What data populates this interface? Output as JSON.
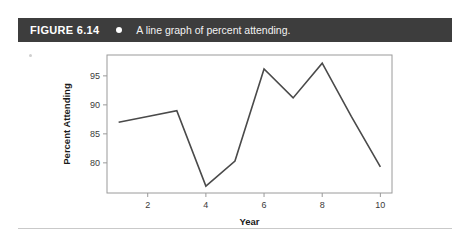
{
  "header": {
    "figure_number": "FIGURE 6.14",
    "bullet_icon": "bullet-dot-icon",
    "caption": "A line graph of percent attending.",
    "background_color": "#3d3d3d",
    "text_color": "#ffffff"
  },
  "chart_data": {
    "type": "line",
    "title": "",
    "xlabel": "Year",
    "ylabel": "Percent Attending",
    "x": [
      1,
      2,
      3,
      4,
      5,
      6,
      7,
      8,
      9,
      10
    ],
    "values": [
      87,
      88,
      89,
      76,
      80.3,
      96.2,
      91.2,
      97.2,
      88,
      79.3
    ],
    "series": [
      {
        "name": "Percent Attending",
        "values": [
          87,
          88,
          89,
          76,
          80.3,
          96.2,
          91.2,
          97.2,
          88,
          79.3
        ]
      }
    ],
    "xtick_labels": [
      "2",
      "4",
      "6",
      "8",
      "10"
    ],
    "xticks": [
      2,
      4,
      6,
      8,
      10
    ],
    "ytick_labels": [
      "80",
      "85",
      "90",
      "95"
    ],
    "yticks": [
      80,
      85,
      90,
      95
    ],
    "xlim": [
      0.6,
      10.4
    ],
    "ylim": [
      74.8,
      98.6
    ],
    "grid": false,
    "legend": false,
    "line_color": "#4a4a4a",
    "frame_color": "#9a9a9a"
  }
}
